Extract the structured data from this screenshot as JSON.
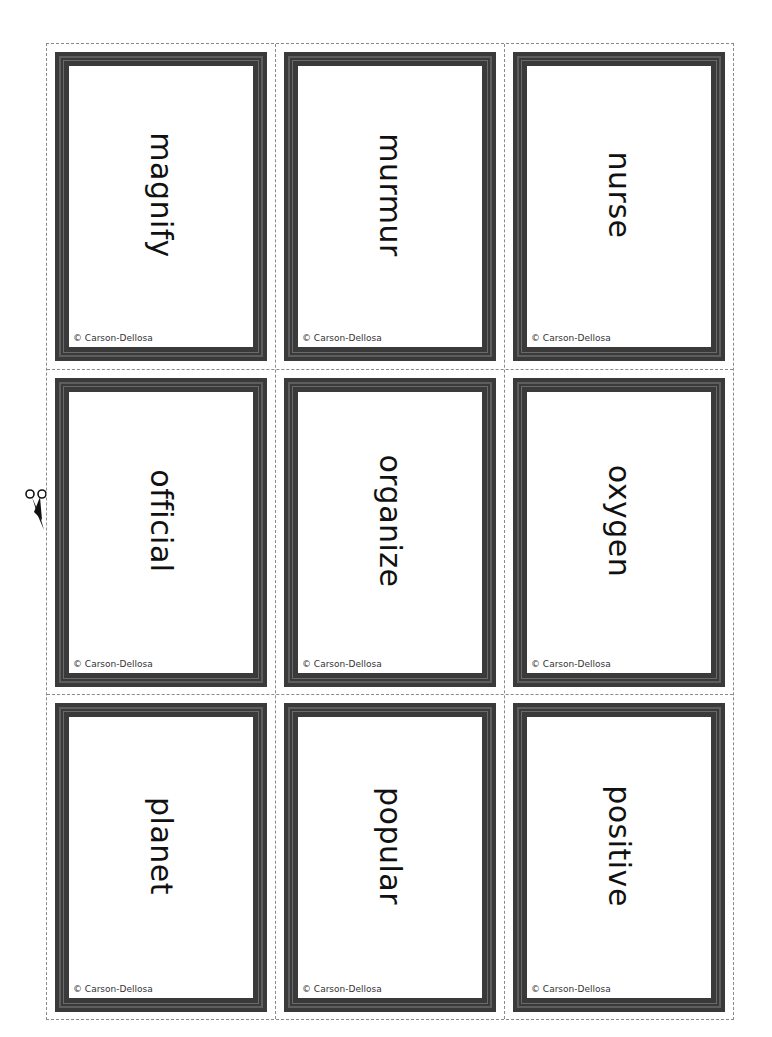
{
  "sheet": {
    "copyright": "© Carson-Dellosa",
    "cards": [
      {
        "word": "magnify"
      },
      {
        "word": "murmur"
      },
      {
        "word": "nurse"
      },
      {
        "word": "official"
      },
      {
        "word": "organize"
      },
      {
        "word": "oxygen"
      },
      {
        "word": "planet"
      },
      {
        "word": "popular"
      },
      {
        "word": "positive"
      }
    ]
  },
  "icons": {
    "scissors": "scissors-icon"
  },
  "colors": {
    "frame": "#3a3a3a",
    "cut_line": "#8a8a8a",
    "background": "#ffffff"
  }
}
